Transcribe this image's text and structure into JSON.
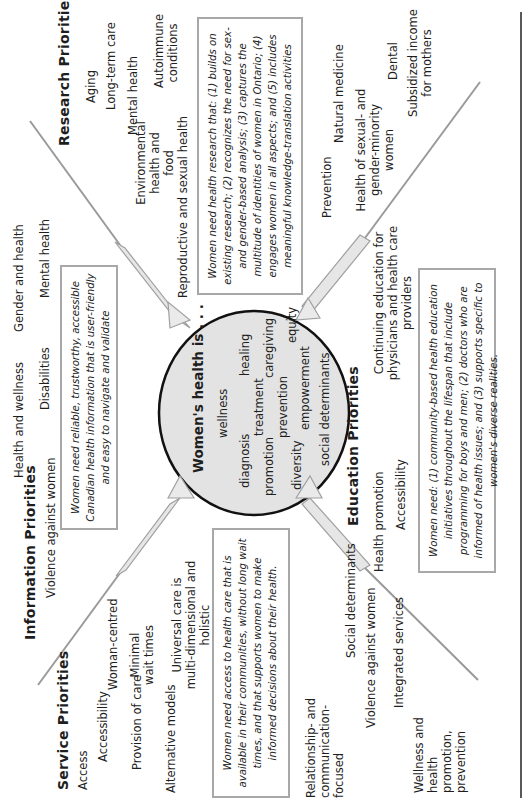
{
  "center": {
    "title": "Women's health is . . .",
    "words": [
      "wellness",
      "healing",
      "diagnosis",
      "treatment",
      "caregiving",
      "promotion",
      "prevention",
      "equity",
      "diversity",
      "empowerment",
      "social determinants"
    ]
  },
  "research": {
    "heading": "Research Priorities",
    "items": [
      "Aging",
      "Long-term care",
      "Mental health",
      "Autoimmune conditions",
      "Environmental health and food",
      "Reproductive and sexual health",
      "Prevention",
      "Natural medicine",
      "Health of sexual- and gender-minority women",
      "Dental",
      "Subsidized income for mothers"
    ],
    "box": "Women need health research that: (1) builds on existing research; (2) recognizes the need for sex- and gender-based analysis; (3) captures the multitude of identities of women in Ontario; (4) engages women in all aspects; and (5) includes meaningful knowledge-translation activities"
  },
  "information": {
    "heading": "Information Priorities",
    "items": [
      "Violence against women",
      "Health and wellness",
      "Gender and health",
      "Disabilities",
      "Mental health"
    ],
    "box": "Women need reliable, trustworthy, accessible Canadian health information that is user-friendly and easy to navigate and validate"
  },
  "service": {
    "heading": "Service Priorities",
    "items": [
      "Access",
      "Accessibility",
      "Woman-centred",
      "Provision of care",
      "Minimal wait times",
      "Alternative models",
      "Universal care is multi-dimensional and holistic",
      "Relationship- and communication-focused",
      "Social determinants",
      "Violence against women",
      "Integrated services",
      "Wellness and health promotion, prevention"
    ],
    "box": "Women need access to health care that is available in their communities, without long wait times, and that supports women to make informed decisions about their health."
  },
  "education": {
    "heading": "Education Priorities",
    "items": [
      "Health promotion",
      "Accessibility",
      "Continuing education for physicians and health care providers"
    ],
    "box": "Women need: (1) community-based health education initiatives throughout the lifespan that include programming for boys and men; (2) doctors who are informed of health issues; and (3) supports specific to women's diverse realities."
  }
}
